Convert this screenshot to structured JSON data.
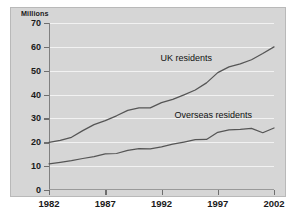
{
  "chart_data": {
    "type": "line",
    "title": "",
    "subtitle": "",
    "ylabel": "Millions",
    "xlabel": "",
    "ylim": [
      0,
      70
    ],
    "xlim": [
      1982,
      2002
    ],
    "yticks": [
      0,
      10,
      20,
      30,
      40,
      50,
      60,
      70
    ],
    "ytick_labels": [
      "0",
      "10",
      "20",
      "30",
      "40",
      "50",
      "60",
      "70"
    ],
    "xticks": [
      1982,
      1987,
      1992,
      1997,
      2002
    ],
    "xtick_labels": [
      "1982",
      "1987",
      "1992",
      "1997",
      "2002"
    ],
    "grid": "horizontal",
    "legend_position": "inline-annotations",
    "x": [
      1982,
      1983,
      1984,
      1985,
      1986,
      1987,
      1988,
      1989,
      1990,
      1991,
      1992,
      1993,
      1994,
      1995,
      1996,
      1997,
      1998,
      1999,
      2000,
      2001,
      2002
    ],
    "series": [
      {
        "name": "UK residents",
        "values": [
          20.0,
          20.8,
          22.1,
          24.9,
          27.4,
          29.1,
          31.1,
          33.4,
          34.4,
          34.4,
          36.6,
          38.0,
          39.9,
          41.9,
          44.9,
          49.2,
          51.6,
          52.9,
          54.6,
          57.2,
          60.0
        ],
        "label_x": 1994.2,
        "label_y": 55.5
      },
      {
        "name": "Overseas residents",
        "values": [
          11.0,
          11.6,
          12.3,
          13.2,
          14.0,
          15.1,
          15.3,
          16.6,
          17.3,
          17.2,
          18.1,
          19.2,
          20.1,
          21.1,
          21.2,
          24.2,
          25.2,
          25.4,
          25.8,
          24.0,
          26.0
        ],
        "label_x": 1996.6,
        "label_y": 31.5
      }
    ]
  }
}
